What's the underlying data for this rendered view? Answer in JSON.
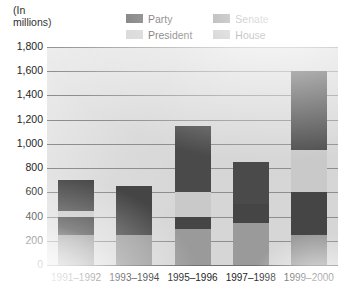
{
  "units_line1": "(In",
  "units_line2": "millions)",
  "legend": [
    {
      "key": "party",
      "label": "Party",
      "color": "#4a4a4a"
    },
    {
      "key": "senate",
      "label": "Senate",
      "color": "#454545"
    },
    {
      "key": "president",
      "label": "President",
      "color": "#c9c9c9"
    },
    {
      "key": "house",
      "label": "House",
      "color": "#9a9a9a"
    }
  ],
  "y_ticks": [
    "1,800",
    "1,600",
    "1,400",
    "1,200",
    "1,000",
    "800",
    "600",
    "400",
    "200",
    "0"
  ],
  "chart_data": {
    "type": "bar",
    "title": "",
    "subtitle": "",
    "xlabel": "",
    "ylabel": "(In millions)",
    "ylim": [
      0,
      1800
    ],
    "ytick_step": 200,
    "grid": true,
    "stacked": true,
    "legend_position": "top",
    "categories": [
      "1991–1992",
      "1993–1994",
      "1995–1996",
      "1997–1998",
      "1999–2000"
    ],
    "series": [
      {
        "name": "House",
        "color": "#9a9a9a",
        "values": [
          250,
          250,
          300,
          350,
          250
        ]
      },
      {
        "name": "Senate",
        "color": "#454545",
        "values": [
          150,
          400,
          100,
          150,
          350
        ]
      },
      {
        "name": "President",
        "color": "#c9c9c9",
        "values": [
          50,
          0,
          200,
          0,
          350
        ]
      },
      {
        "name": "Party",
        "color": "#4a4a4a",
        "values": [
          250,
          0,
          550,
          350,
          650
        ]
      }
    ],
    "totals": [
      700,
      650,
      1150,
      850,
      1600
    ]
  }
}
